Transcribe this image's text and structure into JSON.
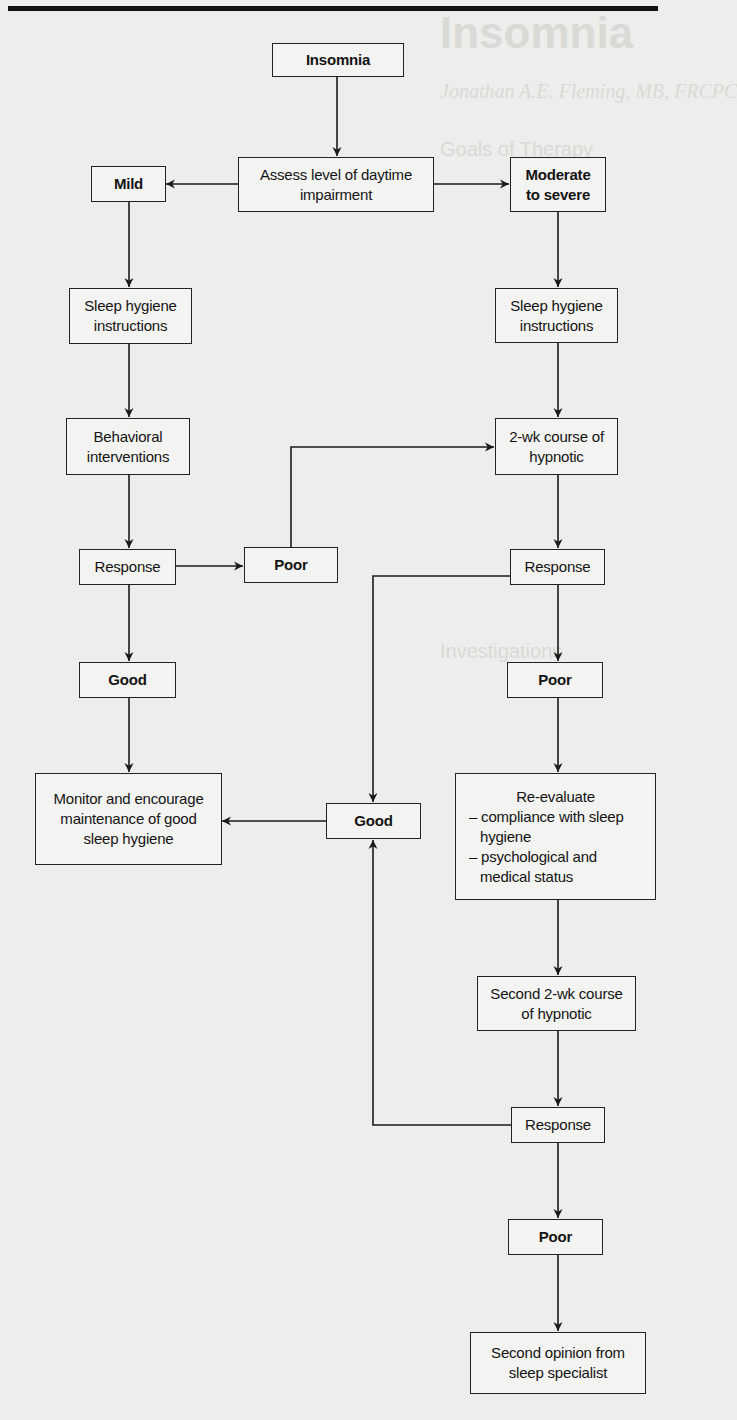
{
  "page": {
    "title": "Insomnia"
  },
  "background_ghost_text": {
    "heading": "Insomnia",
    "author": "Jonathan A.E. Fleming, MB, FRCPC",
    "goals_heading": "Goals of Therapy",
    "investigations_heading": "Investigations"
  },
  "nodes": {
    "insomnia": "Insomnia",
    "assess": "Assess level of daytime impairment",
    "mild": "Mild",
    "moderate": "Moderate to severe",
    "sleep_hygiene_left": "Sleep hygiene instructions",
    "sleep_hygiene_right": "Sleep hygiene instructions",
    "behavioral": "Behavioral interventions",
    "course_hypnotic": "2-wk course of hypnotic",
    "response_left": "Response",
    "poor_mid": "Poor",
    "response_right": "Response",
    "good_left": "Good",
    "poor_right": "Poor",
    "monitor": "Monitor and encourage maintenance of good sleep hygiene",
    "good_mid": "Good",
    "reevaluate": {
      "title": "Re-evaluate",
      "items": [
        "– compliance with sleep hygiene",
        "– psychological and medical status"
      ]
    },
    "second_course": "Second 2-wk course of hypnotic",
    "response_bottom": "Response",
    "poor_bottom": "Poor",
    "second_opinion": "Second opinion from sleep specialist"
  },
  "colors": {
    "line": "#1a1a1a",
    "paper": "#ededeb",
    "box_fill": "#f3f3f1"
  }
}
